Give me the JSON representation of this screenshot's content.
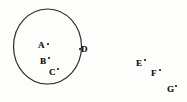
{
  "figure": {
    "kind": "geometric-diagram",
    "background_color": "#fdfdfc",
    "ink_color": "#241e19",
    "circle": {
      "name": "circle-outline",
      "center_x": 47.5,
      "center_y": 46.5,
      "radius_x": 34.0,
      "radius_y": 37.5,
      "stroke_width": 1.15
    },
    "labels": [
      {
        "id": "A",
        "text": "A",
        "x": 38,
        "y": 41,
        "dot_x": 47,
        "dot_y": 43,
        "inside_circle": true
      },
      {
        "id": "B",
        "text": "B",
        "x": 40,
        "y": 57,
        "dot_x": 48,
        "dot_y": 57,
        "inside_circle": true
      },
      {
        "id": "C",
        "text": "C",
        "x": 49,
        "y": 68,
        "dot_x": 57,
        "dot_y": 68,
        "inside_circle": true
      },
      {
        "id": "D",
        "text": "D",
        "x": 81,
        "y": 45,
        "dot_x": 79,
        "dot_y": 48,
        "inside_circle": false
      },
      {
        "id": "E",
        "text": "E",
        "x": 136,
        "y": 59,
        "dot_x": 144,
        "dot_y": 59,
        "inside_circle": false
      },
      {
        "id": "F",
        "text": "F",
        "x": 151,
        "y": 69,
        "dot_x": 159,
        "dot_y": 69,
        "inside_circle": false
      },
      {
        "id": "G",
        "text": "G",
        "x": 167,
        "y": 85,
        "dot_x": 175,
        "dot_y": 85,
        "inside_circle": false
      }
    ]
  }
}
